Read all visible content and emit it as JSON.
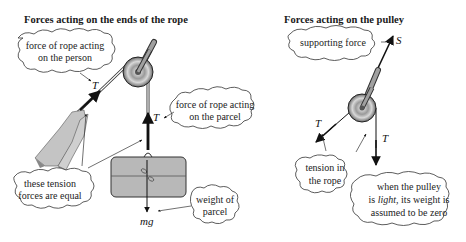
{
  "left_panel": {
    "title": "Forces acting on the ends of the rope",
    "bubbles": {
      "person_force": [
        "force of rope acting",
        "on the person"
      ],
      "parcel_force": [
        "force of rope acting",
        "on the parcel"
      ],
      "equal": [
        "these tension",
        "forces are equal"
      ],
      "weight": [
        "weight of",
        "parcel"
      ]
    },
    "symbols": {
      "tension_person": "T",
      "tension_parcel": "T",
      "weight": "mg"
    }
  },
  "right_panel": {
    "title": "Forces acting on the pulley",
    "bubbles": {
      "support": [
        "supporting force"
      ],
      "tension": [
        "tension in",
        "the rope"
      ],
      "light_pre": "is ",
      "light_word": "light",
      "light_post": ", its weight is",
      "light_line1": "when the pulley",
      "light_line3": "assumed to be zero"
    },
    "symbols": {
      "support": "S",
      "tension_left": "T",
      "tension_down": "T"
    }
  },
  "colors": {
    "ink": "#111111",
    "parcel": "#b8b8b8",
    "hand": "#c4c4c4",
    "rod": "#a0a0a0"
  }
}
